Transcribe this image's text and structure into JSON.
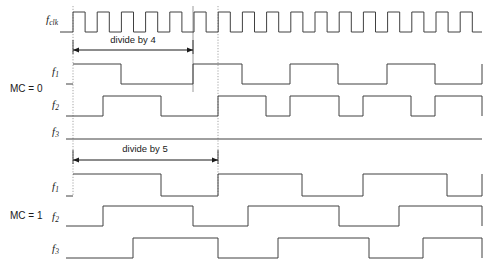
{
  "figure": {
    "type": "timing-diagram",
    "title": "",
    "width": 486,
    "height": 272,
    "background_color": "#ffffff",
    "line_color": "#404040",
    "guide_color": "#9a9a9a",
    "text_color": "#1a1a1a"
  },
  "axis": {
    "t_start": 73,
    "t_end": 482,
    "clock_period": 24.2,
    "clock_duty": 0.5,
    "clock_cycles": 17
  },
  "guides": [
    {
      "name": "guide-left",
      "x": 73,
      "y1": 6,
      "y2": 196,
      "style": "dotted"
    },
    {
      "name": "guide-divide4-end",
      "x": 193,
      "y1": 6,
      "y2": 92,
      "style": "solid"
    },
    {
      "name": "guide-section-break",
      "x": 218,
      "y1": 6,
      "y2": 196,
      "style": "dotted"
    }
  ],
  "groups": [
    {
      "id": "mc0",
      "mode_label": "MC = 0",
      "mode_label_x": 10,
      "mode_label_y": 84,
      "span": {
        "name": "divide-by-4-span",
        "label": "divide by 4",
        "x1": 73,
        "x2": 193,
        "y": 50,
        "text_x": 133,
        "text_y": 44
      },
      "signals": [
        {
          "name": "f_clk",
          "label": "f",
          "subscript": "clk",
          "label_x": 46,
          "label_y": 14,
          "baseline_y": 32,
          "top_y": 12,
          "kind": "clock",
          "start_level": 1,
          "edges": []
        },
        {
          "name": "f_1",
          "label": "f",
          "subscript": "1",
          "label_x": 52,
          "label_y": 66,
          "baseline_y": 84,
          "top_y": 64,
          "kind": "level",
          "start_level": 0,
          "edges": [
            73,
            121,
            193,
            242,
            290,
            338,
            387,
            435,
            482
          ]
        },
        {
          "name": "f_2",
          "label": "f",
          "subscript": "2",
          "label_x": 52,
          "label_y": 99,
          "baseline_y": 116,
          "top_y": 96,
          "kind": "level",
          "start_level": 0,
          "edges": [
            103,
            161,
            218,
            266,
            290,
            339,
            363,
            411,
            435,
            482
          ]
        },
        {
          "name": "f_3",
          "label": "f",
          "subscript": "3",
          "label_x": 52,
          "label_y": 126,
          "baseline_y": 139,
          "top_y": 123,
          "kind": "level",
          "start_level": 0,
          "edges": []
        }
      ]
    },
    {
      "id": "mc1",
      "mode_label": "MC = 1",
      "mode_label_x": 10,
      "mode_label_y": 211,
      "span": {
        "name": "divide-by-5-span",
        "label": "divide by 5",
        "x1": 73,
        "x2": 218,
        "y": 160,
        "text_x": 145,
        "text_y": 153
      },
      "signals": [
        {
          "name": "f_1",
          "label": "f",
          "subscript": "1",
          "label_x": 52,
          "label_y": 181,
          "baseline_y": 196,
          "top_y": 174,
          "kind": "level",
          "start_level": 0,
          "edges": [
            73,
            161,
            218,
            302,
            363,
            447,
            482
          ]
        },
        {
          "name": "f_2",
          "label": "f",
          "subscript": "2",
          "label_x": 52,
          "label_y": 211,
          "baseline_y": 226,
          "top_y": 206,
          "kind": "level",
          "start_level": 0,
          "edges": [
            103,
            193,
            248,
            339,
            399,
            482
          ]
        },
        {
          "name": "f_3",
          "label": "f",
          "subscript": "3",
          "label_x": 52,
          "label_y": 243,
          "baseline_y": 258,
          "top_y": 238,
          "kind": "level",
          "start_level": 0,
          "edges": [
            133,
            218,
            278,
            369,
            423,
            482
          ]
        }
      ]
    }
  ],
  "chart_data": {
    "type": "timing",
    "xlabel": "time",
    "ylabel": "",
    "annotations": [
      "divide by 4",
      "divide by 5"
    ],
    "modes": [
      {
        "mode": "MC = 0",
        "division": 4,
        "signals": [
          {
            "name": "f_clk",
            "description": "reference clock, square wave"
          },
          {
            "name": "f_1",
            "description": "divide by 4 output, phase 0"
          },
          {
            "name": "f_2",
            "description": "divide by 4 output, phase shifted"
          },
          {
            "name": "f_3",
            "description": "held low (inactive)"
          }
        ]
      },
      {
        "mode": "MC = 1",
        "division": 5,
        "signals": [
          {
            "name": "f_1",
            "description": "divide by 5 output, phase 0"
          },
          {
            "name": "f_2",
            "description": "divide by 5 output, phase shifted"
          },
          {
            "name": "f_3",
            "description": "divide by 5 output, phase shifted further"
          }
        ]
      }
    ]
  }
}
